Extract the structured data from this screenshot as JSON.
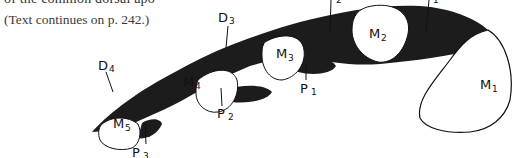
{
  "page": {
    "cut_text": "of the common dorsal apo",
    "caption": "(Text continues on p. 242.)"
  },
  "figure": {
    "bones": [
      {
        "id": "M1",
        "letter": "M",
        "sub": "1"
      },
      {
        "id": "M2",
        "letter": "M",
        "sub": "2"
      },
      {
        "id": "M3",
        "letter": "M",
        "sub": "3"
      },
      {
        "id": "M4",
        "letter": "M",
        "sub": "4"
      },
      {
        "id": "M5",
        "letter": "M",
        "sub": "5"
      }
    ],
    "dorsal_interossei": [
      {
        "id": "D1",
        "letter": "D",
        "sub": "1"
      },
      {
        "id": "D2",
        "letter": "D",
        "sub": "2"
      },
      {
        "id": "D3",
        "letter": "D",
        "sub": "3"
      },
      {
        "id": "D4",
        "letter": "D",
        "sub": "4"
      }
    ],
    "palmar_interossei": [
      {
        "id": "P1",
        "letter": "P",
        "sub": "1"
      },
      {
        "id": "P2",
        "letter": "P",
        "sub": "2"
      },
      {
        "id": "P3",
        "letter": "P",
        "sub": "3"
      }
    ],
    "colors": {
      "muscle": "#1c1c1c",
      "bone_fill": "#ffffff",
      "outline": "#111111"
    }
  }
}
